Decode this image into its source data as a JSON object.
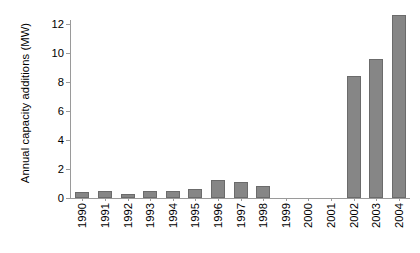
{
  "chart_data": {
    "type": "bar",
    "title": "",
    "xlabel": "",
    "ylabel": "Annual capacity additions (MW)",
    "categories": [
      "1990",
      "1991",
      "1992",
      "1993",
      "1994",
      "1995",
      "1996",
      "1997",
      "1998",
      "1999",
      "2000",
      "2001",
      "2002",
      "2003",
      "2004"
    ],
    "values": [
      0.4,
      0.45,
      0.3,
      0.5,
      0.5,
      0.65,
      1.25,
      1.1,
      0.85,
      0,
      0,
      0,
      8.4,
      9.6,
      12.6
    ],
    "ylim": [
      0,
      13.2
    ],
    "yticks": [
      0,
      2,
      4,
      6,
      8,
      10,
      12
    ],
    "ytick_labels": [
      "0",
      "2",
      "4",
      "6",
      "8",
      "10",
      "12"
    ],
    "grid": false,
    "legend": null,
    "series_color": "#868686",
    "axis_color": "#9a9a9a"
  }
}
